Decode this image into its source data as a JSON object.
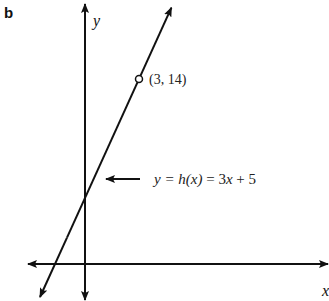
{
  "chart_data": {
    "type": "line",
    "panel_label": "b",
    "xlabel": "x",
    "ylabel": "y",
    "function": {
      "slope": 3,
      "intercept": 5
    },
    "equation_label": {
      "lhs": "y = ",
      "fn": "h(x)",
      "eq": " = 3",
      "var": "x",
      "rest": " + 5"
    },
    "points": [
      {
        "x": 3,
        "y": 14,
        "label": "(3, 14)",
        "marker": "open-circle"
      }
    ],
    "grid": false,
    "legend": "none"
  }
}
